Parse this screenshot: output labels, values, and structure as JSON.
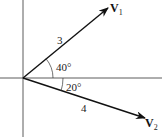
{
  "diagram": {
    "type": "vector-diagram",
    "origin": {
      "x": 23,
      "y": 78
    },
    "axes": {
      "horizontal": {
        "x1": 0,
        "x2": 162,
        "y": 78
      },
      "vertical": {
        "x": 23,
        "y1": 0,
        "y2": 137
      }
    },
    "vectors": [
      {
        "name": "V1",
        "label_main": "V",
        "label_sub": "1",
        "magnitude_label": "3",
        "angle_label": "40°",
        "angle_deg": 40,
        "direction": "above horizontal",
        "tip": {
          "x": 108,
          "y": 8
        }
      },
      {
        "name": "V2",
        "label_main": "V",
        "label_sub": "2",
        "magnitude_label": "4",
        "angle_label": "20°",
        "angle_deg": 20,
        "direction": "below horizontal",
        "tip": {
          "x": 145,
          "y": 118
        }
      }
    ],
    "colors": {
      "axis": "#333333",
      "vector": "#111111",
      "text": "#222222"
    }
  }
}
